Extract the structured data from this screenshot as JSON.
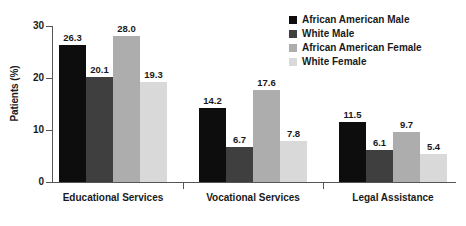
{
  "chart_data": {
    "type": "bar",
    "title": "",
    "xlabel": "",
    "ylabel": "Patients (%)",
    "ylim": [
      0,
      30
    ],
    "yticks": [
      0,
      10,
      20,
      30
    ],
    "ytick_labels": [
      "0",
      "10",
      "20",
      "30"
    ],
    "grid": false,
    "legend_position": "top-right",
    "categories": [
      "Educational Services",
      "Vocational Services",
      "Legal Assistance"
    ],
    "series": [
      {
        "name": "African American Male",
        "color": "#0d0d0d",
        "values": [
          26.3,
          14.2,
          11.5
        ],
        "labels": [
          "26.3",
          "14.2",
          "11.5"
        ]
      },
      {
        "name": "White Male",
        "color": "#3f3f3f",
        "values": [
          20.1,
          6.7,
          6.1
        ],
        "labels": [
          "20.1",
          "6.7",
          "6.1"
        ]
      },
      {
        "name": "African American Female",
        "color": "#adadad",
        "values": [
          28.0,
          17.6,
          9.7
        ],
        "labels": [
          "28.0",
          "17.6",
          "9.7"
        ]
      },
      {
        "name": "White Female",
        "color": "#d9d9d9",
        "values": [
          19.3,
          7.8,
          5.4
        ],
        "labels": [
          "19.3",
          "7.8",
          "5.4"
        ]
      }
    ]
  }
}
